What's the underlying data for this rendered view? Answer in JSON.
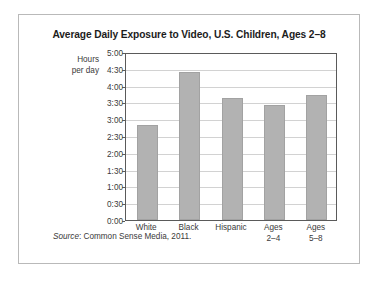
{
  "figure": {
    "title": "Average Daily Exposure to Video, U.S. Children, Ages 2–8",
    "y_caption_line1": "Hours",
    "y_caption_line2": "per day",
    "source_label": "Source",
    "source_text": ": Common Sense Media, 2011."
  },
  "chart_data": {
    "type": "bar",
    "title": "Average Daily Exposure to Video, U.S. Children, Ages 2–8",
    "xlabel": "",
    "ylabel": "Hours per day",
    "categories": [
      "White",
      "Black",
      "Hispanic",
      "Ages 2–4",
      "Ages 5–8"
    ],
    "category_lines": [
      [
        "White"
      ],
      [
        "Black"
      ],
      [
        "Hispanic"
      ],
      [
        "Ages",
        "2–4"
      ],
      [
        "Ages",
        "5–8"
      ]
    ],
    "values_hours": [
      2.82,
      4.42,
      3.64,
      3.42,
      3.73
    ],
    "values_formatted": [
      "2:49",
      "4:25",
      "3:38",
      "3:25",
      "3:44"
    ],
    "ylim": [
      0,
      5
    ],
    "ytick_values": [
      0,
      0.5,
      1,
      1.5,
      2,
      2.5,
      3,
      3.5,
      4,
      4.5,
      5
    ],
    "ytick_labels": [
      "0:00",
      "0:30",
      "1:00",
      "1:30",
      "2:00",
      "2:30",
      "3:00",
      "3:30",
      "4:00",
      "4:30",
      "5:00"
    ],
    "grid": true,
    "legend": null,
    "bar_color": "#b2b2b2",
    "bar_border_color": "#a2a2a2",
    "gridline_color": "#d2d2d2",
    "axis_color": "#5a5a5a"
  }
}
